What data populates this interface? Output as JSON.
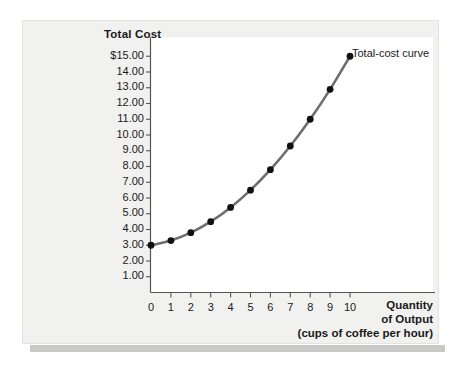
{
  "figure": {
    "y_axis_title": "Total Cost",
    "x_axis_title_line1": "Quantity",
    "x_axis_title_line2": "of Output",
    "x_axis_title_line3": "(cups of coffee per hour)",
    "curve_label": "Total-cost curve",
    "curve_color": "#6e6e6e",
    "point_color": "#111111",
    "axis_color": "#555555",
    "panel_background": "#f1f1ef",
    "plot_background": "#ffffff"
  },
  "chart_data": {
    "type": "line",
    "title": "",
    "xlabel": "Quantity of Output (cups of coffee per hour)",
    "ylabel": "Total Cost",
    "xlim": [
      0,
      10
    ],
    "ylim": [
      0,
      15
    ],
    "grid": false,
    "legend_position": "inline-annotation",
    "x_tick_labels": [
      "0",
      "1",
      "2",
      "3",
      "4",
      "5",
      "6",
      "7",
      "8",
      "9",
      "10"
    ],
    "y_tick_labels": [
      "1.00",
      "2.00",
      "3.00",
      "4.00",
      "5.00",
      "6.00",
      "7.00",
      "8.00",
      "9.00",
      "10.00",
      "11.00",
      "12.00",
      "13.00",
      "14.00",
      "$15.00"
    ],
    "y_tick_values": [
      1,
      2,
      3,
      4,
      5,
      6,
      7,
      8,
      9,
      10,
      11,
      12,
      13,
      14,
      15
    ],
    "series": [
      {
        "name": "Total-cost curve",
        "x": [
          0,
          1,
          2,
          3,
          4,
          5,
          6,
          7,
          8,
          9,
          10
        ],
        "values": [
          3.0,
          3.3,
          3.8,
          4.5,
          5.4,
          6.5,
          7.8,
          9.3,
          11.0,
          12.9,
          15.0
        ]
      }
    ],
    "annotations": [
      {
        "text": "Total-cost curve",
        "x": 10,
        "y": 15.0
      }
    ]
  }
}
